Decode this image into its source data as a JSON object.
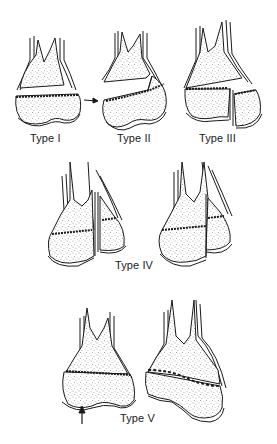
{
  "figure": {
    "panels": [
      {
        "id": "type-1",
        "label": "Type I"
      },
      {
        "id": "type-2",
        "label": "Type II"
      },
      {
        "id": "type-3",
        "label": "Type III"
      },
      {
        "id": "type-4",
        "label": "Type IV"
      },
      {
        "id": "type-5",
        "label": "Type V"
      }
    ]
  },
  "colors": {
    "ink": "#1a1a1a",
    "stipple": "#555555",
    "background": "#ffffff"
  }
}
